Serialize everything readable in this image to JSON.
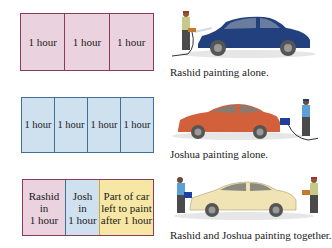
{
  "rows": [
    {
      "cells": [
        "1 hour",
        "1 hour",
        "1 hour"
      ],
      "caption": "Rashid painting alone.",
      "color": "#ead3df",
      "car_color": "#23407e"
    },
    {
      "cells": [
        "1 hour",
        "1 hour",
        "1 hour",
        "1 hour"
      ],
      "caption": "Joshua painting alone.",
      "color": "#cfe0ef",
      "car_color": "#d2603a"
    },
    {
      "cells": [
        {
          "line1": "Rashid",
          "line2": "in",
          "line3": "1 hour"
        },
        {
          "line1": "Josh",
          "line2": "in",
          "line3": "1 hour"
        },
        {
          "line1": "Part of car",
          "line2": "left to paint",
          "line3": "after 1 hour"
        }
      ],
      "caption": "Rashid and Joshua painting together.",
      "colors": [
        "#ead3df",
        "#cfe0ef",
        "#f7e7a4"
      ],
      "car_color": "#f1e4b4"
    }
  ]
}
